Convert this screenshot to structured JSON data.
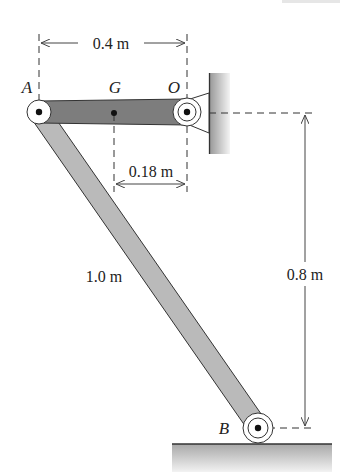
{
  "header": {
    "cropped_text": "12.8.0"
  },
  "points": {
    "A": "A",
    "G": "G",
    "O": "O",
    "B": "B"
  },
  "dimensions": {
    "AO": "0.4 m",
    "GO": "0.18 m",
    "AB": "1.0 m",
    "vertical": "0.8 m"
  },
  "colors": {
    "link_AO": "#7a7a7a",
    "link_AB": "#b8b8b8",
    "wall": "#c9c9c9",
    "ground": "#bdbdbd",
    "lines": "#333333"
  }
}
